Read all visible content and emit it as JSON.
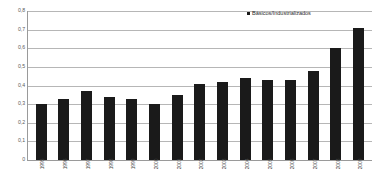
{
  "chart_data": {
    "type": "bar",
    "title": "",
    "xlabel": "",
    "ylabel": "",
    "categories": [
      "1995",
      "1996",
      "1997",
      "1998",
      "1999",
      "2000",
      "2001",
      "2002",
      "2003",
      "2004",
      "2005",
      "2006",
      "2007",
      "2008",
      "2009"
    ],
    "values": [
      0.3,
      0.33,
      0.37,
      0.34,
      0.33,
      0.3,
      0.35,
      0.41,
      0.42,
      0.44,
      0.43,
      0.43,
      0.48,
      0.6,
      0.71
    ],
    "series": [
      {
        "name": "Básicos/Industrializados",
        "values": [
          0.3,
          0.33,
          0.37,
          0.34,
          0.33,
          0.3,
          0.35,
          0.41,
          0.42,
          0.44,
          0.43,
          0.43,
          0.48,
          0.6,
          0.71
        ]
      }
    ],
    "ylim": [
      0,
      0.8
    ],
    "yticks": [
      "0",
      "0,1",
      "0,2",
      "0,3",
      "0,4",
      "0,5",
      "0,6",
      "0,7",
      "0,8"
    ],
    "ytick_values": [
      0,
      0.1,
      0.2,
      0.3,
      0.4,
      0.5,
      0.6,
      0.7,
      0.8
    ],
    "grid": true,
    "legend_position": "top-right",
    "bar_color": "#1a1a1a",
    "grid_color": "#b6b6b6",
    "axis_color": "#9a9a9a"
  },
  "legend": {
    "entries": [
      {
        "label": "Básicos/Industrializados",
        "color": "#1a1a1a"
      }
    ]
  }
}
